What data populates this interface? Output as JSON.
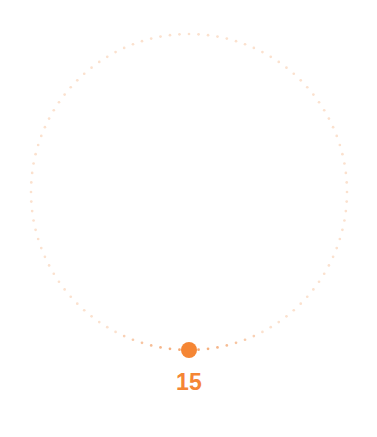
{
  "widget": {
    "name": "circular-value-slider",
    "background_color": "#FFFFFF"
  },
  "dial": {
    "center_x": 189,
    "center_y": 192,
    "radius": 158,
    "track_style": "dotted",
    "track_dot_radius": 1.35,
    "track_dot_count": 104,
    "track_color": "#FBE1CE",
    "track_color_active": "#F3A269",
    "active_arc_span_degrees": 26
  },
  "handle": {
    "name": "slider-handle",
    "center_x": 189,
    "center_y": 350,
    "diameter": 16,
    "color": "#F58634",
    "angle_degrees": 90
  },
  "value": {
    "text": "15",
    "color": "#F58634",
    "label_x": 189,
    "label_y": 371
  }
}
